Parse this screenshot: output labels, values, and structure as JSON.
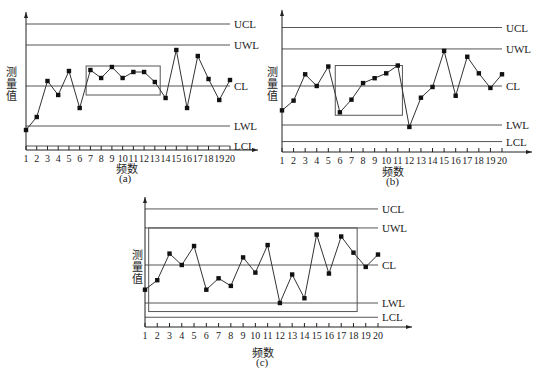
{
  "colors": {
    "line": "#333333",
    "limit": "#555555",
    "marker": "#111111",
    "box": "#555555"
  },
  "chart_data": [
    {
      "type": "line",
      "id": "a",
      "caption": "(a)",
      "title": "",
      "xlabel": "频数",
      "ylabel": "测量值",
      "x": [
        1,
        2,
        3,
        4,
        5,
        6,
        7,
        8,
        9,
        10,
        11,
        12,
        13,
        14,
        15,
        16,
        17,
        18,
        19,
        20
      ],
      "series": [
        {
          "name": "测量值",
          "values": [
            -2.2,
            -1.55,
            0.25,
            -0.45,
            0.75,
            -1.1,
            0.8,
            0.4,
            0.95,
            0.4,
            0.7,
            0.7,
            0.2,
            -0.6,
            1.8,
            -1.1,
            1.5,
            0.35,
            -0.7,
            0.3
          ]
        }
      ],
      "control_lines": [
        {
          "label": "UCL",
          "value": 3.1
        },
        {
          "label": "UWL",
          "value": 2.05
        },
        {
          "label": "CL",
          "value": 0
        },
        {
          "label": "LWL",
          "value": -2.0
        },
        {
          "label": "LCL",
          "value": -3.0
        }
      ],
      "highlight_box": {
        "from_x": 6.6,
        "to_x": 13.5,
        "y_top": 1.0,
        "y_bottom": -0.45
      },
      "ylim": [
        -3.2,
        3.7
      ],
      "grid": false,
      "axis_ticks": true
    },
    {
      "type": "line",
      "id": "b",
      "caption": "(b)",
      "title": "",
      "xlabel": "频数",
      "ylabel": "测量值",
      "x": [
        1,
        2,
        3,
        4,
        5,
        6,
        7,
        8,
        9,
        10,
        11,
        12,
        13,
        14,
        15,
        16,
        17,
        18,
        19,
        20
      ],
      "series": [
        {
          "name": "测量值",
          "values": [
            -1.25,
            -0.75,
            0.6,
            0,
            1.0,
            -1.35,
            -0.7,
            0.15,
            0.4,
            0.65,
            1.05,
            -2.1,
            -0.6,
            -0.05,
            1.8,
            -0.5,
            1.5,
            0.65,
            -0.1,
            0.6
          ]
        }
      ],
      "control_lines": [
        {
          "label": "UCL",
          "value": 3.0
        },
        {
          "label": "UWL",
          "value": 1.9
        },
        {
          "label": "CL",
          "value": 0
        },
        {
          "label": "LWL",
          "value": -2.0
        },
        {
          "label": "LCL",
          "value": -2.85
        }
      ],
      "highlight_box": {
        "from_x": 5.6,
        "to_x": 11.4,
        "y_top": 1.05,
        "y_bottom": -1.5
      },
      "ylim": [
        -3.3,
        3.6
      ],
      "grid": false,
      "axis_ticks": true
    },
    {
      "type": "line",
      "id": "c",
      "caption": "(c)",
      "title": "",
      "xlabel": "频数",
      "ylabel": "测量值",
      "x": [
        1,
        2,
        3,
        4,
        5,
        6,
        7,
        8,
        9,
        10,
        11,
        12,
        13,
        14,
        15,
        16,
        17,
        18,
        19,
        20
      ],
      "series": [
        {
          "name": "测量值",
          "values": [
            -1.3,
            -0.8,
            0.6,
            0,
            1.0,
            -1.3,
            -0.7,
            -1.1,
            0.4,
            -0.4,
            1.05,
            -2.0,
            -0.5,
            -1.75,
            1.6,
            -0.45,
            1.5,
            0.65,
            -0.1,
            0.55
          ]
        }
      ],
      "control_lines": [
        {
          "label": "UCL",
          "value": 2.95
        },
        {
          "label": "UWL",
          "value": 1.95
        },
        {
          "label": "CL",
          "value": 0
        },
        {
          "label": "LWL",
          "value": -2.0
        },
        {
          "label": "LCL",
          "value": -2.75
        }
      ],
      "highlight_box": {
        "from_x": 1.3,
        "to_x": 18.3,
        "y_top": 1.95,
        "y_bottom": -2.45
      },
      "ylim": [
        -3.3,
        3.8
      ],
      "grid": false,
      "axis_ticks": true
    }
  ]
}
